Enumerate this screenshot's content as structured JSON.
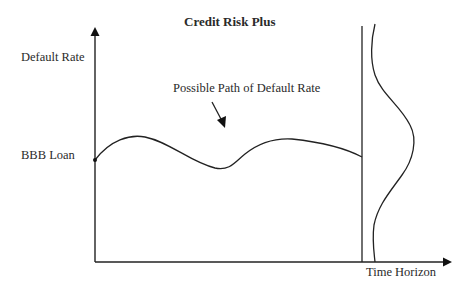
{
  "title": "Credit Risk Plus",
  "labels": {
    "y_axis": "Default Rate",
    "x_axis": "Time Horizon",
    "start_point": "BBB Loan",
    "path_annotation": "Possible Path of Default Rate"
  },
  "colors": {
    "line": "#222222",
    "background": "#ffffff"
  }
}
